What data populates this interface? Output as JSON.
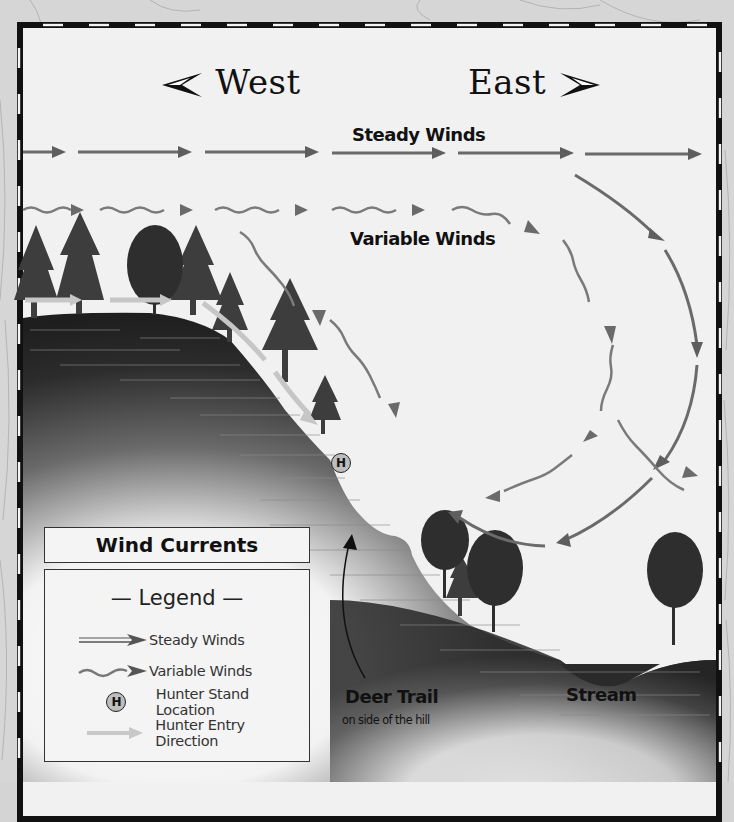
{
  "title": "Wind Currents",
  "directions": {
    "west": "West",
    "east": "East"
  },
  "labels": {
    "steady_winds": "Steady Winds",
    "variable_winds": "Variable Winds",
    "deer_trail": "Deer Trail",
    "deer_trail_sub": "on side of the hill",
    "stream": "Stream"
  },
  "hunter_stand_marker": "H",
  "legend": {
    "title": "— Legend —",
    "items": [
      {
        "icon": "steady-wind-arrow-icon",
        "label": "Steady Winds"
      },
      {
        "icon": "variable-wind-arrow-icon",
        "label": "Variable Winds"
      },
      {
        "icon": "hunter-stand-icon",
        "symbol": "H",
        "label": "Hunter Stand Location"
      },
      {
        "icon": "hunter-entry-arrow-icon",
        "label": "Hunter Entry Direction"
      }
    ]
  },
  "colors": {
    "paper": "#f1f1f1",
    "frame": "#111111",
    "arrow_dark": "#6a6a6a",
    "arrow_light": "#bdbdbd",
    "entry_arrow": "#c8c8c8",
    "hill_dark": "#2a2a2a",
    "tree": "#3a3a3a"
  }
}
